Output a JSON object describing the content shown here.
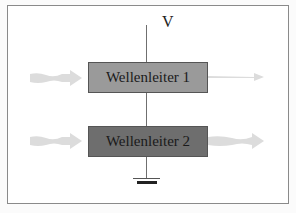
{
  "diagram": {
    "voltage_label": "V",
    "waveguides": [
      {
        "label": "Wellenleiter 1",
        "fill": "#9a9a9a"
      },
      {
        "label": "Wellenleiter 2",
        "fill": "#6e6e6e"
      }
    ],
    "arrow_color": "#d9d9d9",
    "ground_symbol": "ground-icon"
  }
}
